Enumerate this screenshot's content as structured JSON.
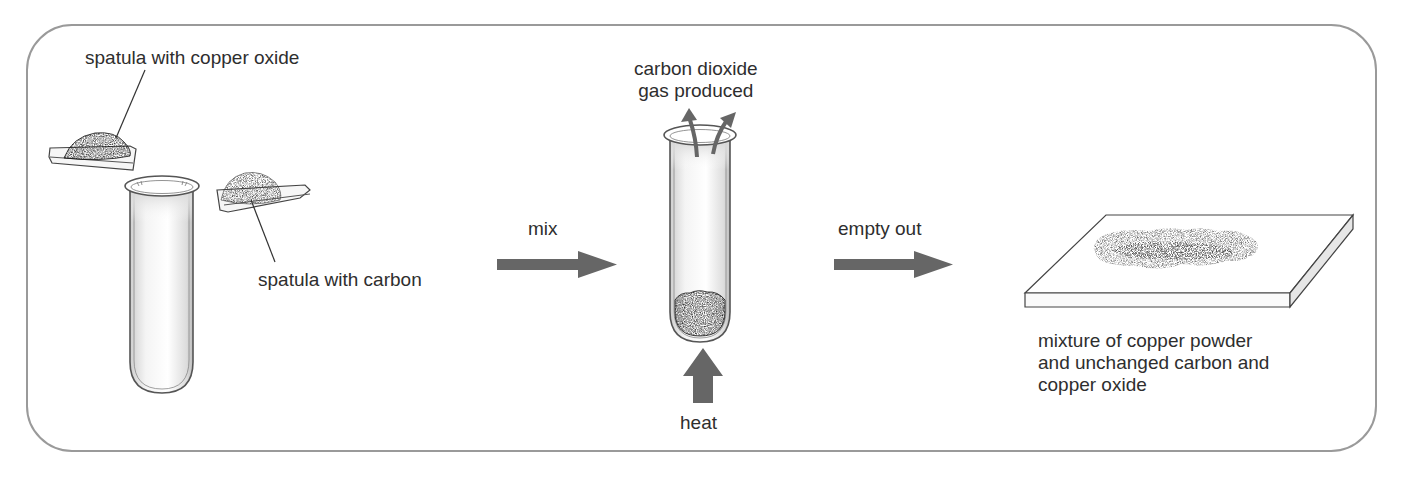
{
  "diagram": {
    "type": "process-flow",
    "steps": [
      {
        "id": "prepare",
        "labels": {
          "copper_oxide_spatula": "spatula with copper oxide",
          "carbon_spatula": "spatula with carbon"
        }
      },
      {
        "id": "heat",
        "labels": {
          "gas": "carbon dioxide\ngas produced",
          "heat": "heat"
        }
      },
      {
        "id": "result",
        "labels": {
          "mixture": "mixture of copper powder\nand unchanged carbon and\ncopper oxide"
        }
      }
    ],
    "transitions": [
      {
        "from": "prepare",
        "to": "heat",
        "label": "mix"
      },
      {
        "from": "heat",
        "to": "result",
        "label": "empty out"
      }
    ]
  },
  "colors": {
    "frame": "#9a9a9a",
    "arrow": "#666666",
    "text": "#2e2e2e",
    "copper_oxide": "#151515",
    "carbon": "#4a4a4a",
    "mixture": "#6a6a6a"
  }
}
